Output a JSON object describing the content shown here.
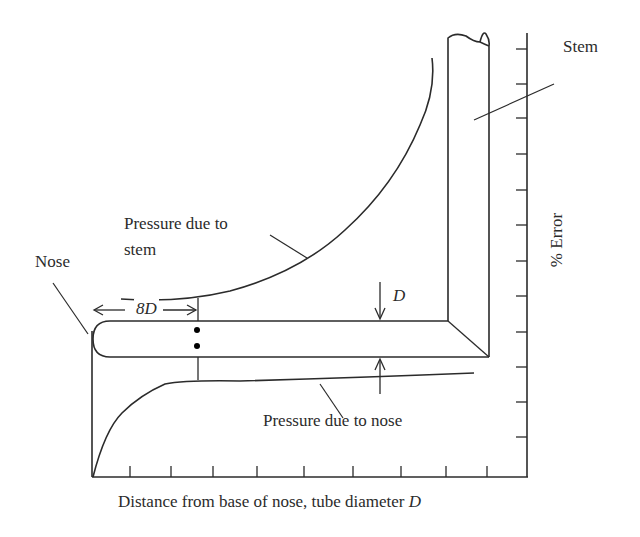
{
  "figure": {
    "labels": {
      "stem": "Stem",
      "nose": "Nose",
      "pressure_stem_line1": "Pressure due to",
      "pressure_stem_line2": "stem",
      "pressure_nose": "Pressure due to nose",
      "dimension_8d": "8D",
      "dimension_d": "D",
      "y_axis": "% Error",
      "x_axis_text": "Distance from base of nose, tube diameter ",
      "x_axis_var": "D"
    },
    "colors": {
      "ink": "#2b2b2b",
      "background": "#ffffff"
    },
    "axes": {
      "x_tick_count": 9,
      "y_tick_count": 12
    }
  }
}
